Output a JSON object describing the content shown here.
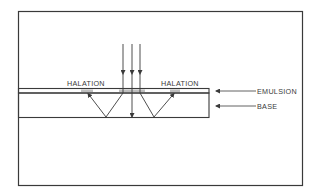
{
  "diagram": {
    "labels": {
      "halation_left": "HALATION",
      "halation_right": "HALATION",
      "emulsion": "EMULSION",
      "base": "BASE"
    },
    "colors": {
      "line": "#3a3a3a",
      "background": "#ffffff",
      "halation_smudge": "#8a8a8a"
    },
    "elements": {
      "incident_rays": 3,
      "layers": [
        "emulsion",
        "base"
      ]
    }
  }
}
